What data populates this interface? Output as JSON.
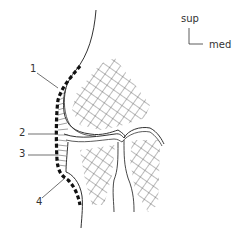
{
  "orientation": {
    "vertical_label": "sup",
    "horizontal_label": "med"
  },
  "labels": [
    {
      "id": "1",
      "text": "1"
    },
    {
      "id": "2",
      "text": "2"
    },
    {
      "id": "3",
      "text": "3"
    },
    {
      "id": "4",
      "text": "4"
    }
  ],
  "colors": {
    "line": "#333333",
    "hatch": "#555555",
    "background": "#ffffff"
  }
}
